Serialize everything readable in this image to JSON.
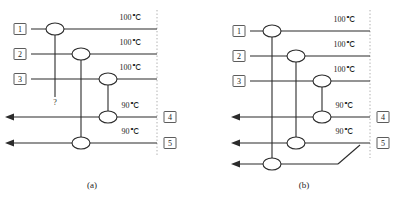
{
  "figure": {
    "panels": [
      {
        "id": "a",
        "caption": "(a)",
        "hot_streams": [
          {
            "tag": "1",
            "temperature": "100℃"
          },
          {
            "tag": "2",
            "temperature": "100℃"
          },
          {
            "tag": "3",
            "temperature": "100℃"
          }
        ],
        "cold_streams": [
          {
            "tag": "4",
            "temperature": "90℃"
          },
          {
            "tag": "5",
            "temperature": "90℃"
          }
        ],
        "unknown_marker": "?",
        "matches": [
          {
            "name": "match-1-unknown",
            "from_stream": "1",
            "to_stream": "?"
          },
          {
            "name": "match-2-5",
            "from_stream": "2",
            "to_stream": "5"
          },
          {
            "name": "match-3-4",
            "from_stream": "3",
            "to_stream": "4"
          }
        ],
        "exchanger_count": 6
      },
      {
        "id": "b",
        "caption": "(b)",
        "hot_streams": [
          {
            "tag": "1",
            "temperature": "100℃"
          },
          {
            "tag": "2",
            "temperature": "100℃"
          },
          {
            "tag": "3",
            "temperature": "100℃"
          }
        ],
        "cold_streams": [
          {
            "tag": "4",
            "temperature": "90℃"
          },
          {
            "tag": "5",
            "temperature": "90℃"
          }
        ],
        "extra_stream": {
          "tag": "",
          "temperature": ""
        },
        "matches": [
          {
            "name": "match-1-6",
            "from_stream": "1",
            "to_stream": "6"
          },
          {
            "name": "match-2-5",
            "from_stream": "2",
            "to_stream": "5"
          },
          {
            "name": "match-3-4",
            "from_stream": "3",
            "to_stream": "4"
          }
        ],
        "exchanger_count": 6,
        "has_diagonal_connector": true
      }
    ],
    "colors": {
      "line": "#2b2b2b",
      "boundary": "#9a9a9a",
      "background": "#ffffff",
      "tag_border": "#4a4a4a"
    }
  }
}
